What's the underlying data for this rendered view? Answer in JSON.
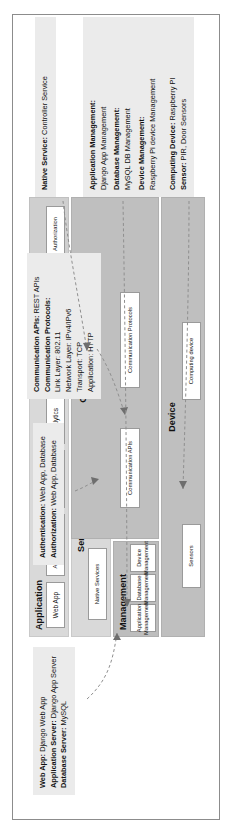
{
  "figure": {
    "orientation": "rotated-90-ccw",
    "colors": {
      "layer_light": "#d9d9d9",
      "layer_dark": "#bfbfbf",
      "cell_fill": "#ffffff",
      "callout_fill": "#ebebeb",
      "connector": "#8f8f8f",
      "frame_border": "#8c8c8c"
    }
  },
  "stack": {
    "layers": [
      {
        "id": "application",
        "label": "Application",
        "cells": [
          {
            "label": "Web App"
          },
          {
            "label": "Application Server"
          },
          {
            "label": "Database Server"
          },
          {
            "label": "Analytics"
          },
          {
            "label": "Observer"
          }
        ]
      },
      {
        "id": "security",
        "label": "Security",
        "cells": [
          {
            "label": "Authentication"
          },
          {
            "label": "Authorization"
          }
        ]
      },
      {
        "id": "services",
        "label": "Services",
        "cells": [
          {
            "label": "Native Services"
          },
          {
            "label": "Web Services"
          }
        ]
      },
      {
        "id": "management",
        "label": "Management",
        "cells": [
          {
            "label": "Application Management"
          },
          {
            "label": "Database Management"
          },
          {
            "label": "Device Management"
          }
        ]
      },
      {
        "id": "communication",
        "label": "Communication",
        "cells": [
          {
            "label": "Communication APIs"
          },
          {
            "label": "Communication Protocols"
          }
        ]
      },
      {
        "id": "device",
        "label": "Device",
        "cells": [
          {
            "label": "Sensors"
          },
          {
            "label": "Computing device"
          }
        ]
      }
    ]
  },
  "callouts": {
    "application_stack": {
      "id": "callout-application-stack",
      "lines": [
        {
          "term": "Web App:",
          "value": " Django Web App"
        },
        {
          "term": "Application Server:",
          "value": " Django App Server"
        },
        {
          "term": "Database Server:",
          "value": " MySQL"
        }
      ]
    },
    "security": {
      "id": "callout-security",
      "lines": [
        {
          "term": "Authentication:",
          "value": " Web App, Database"
        },
        {
          "term": "Authorization:",
          "value": " Web App, Database"
        }
      ]
    },
    "communication": {
      "id": "callout-communication",
      "lines": [
        {
          "term": "Communication APIs:",
          "value": " REST APIs"
        },
        {
          "term": "Communication Protocols:",
          "value": ""
        },
        {
          "term": "",
          "value": "Link Layer: 802.11"
        },
        {
          "term": "",
          "value": "Network Layer: IPv4/IPv6"
        },
        {
          "term": "",
          "value": "Transport: TCP"
        },
        {
          "term": "",
          "value": "Application: HTTP"
        }
      ]
    },
    "native_service": {
      "id": "callout-native-service",
      "lines": [
        {
          "term": "Native Service:",
          "value": " Controller Service"
        }
      ]
    },
    "management": {
      "id": "callout-management",
      "lines": [
        {
          "term": "Application Management:",
          "value": ""
        },
        {
          "term": "",
          "value": "Django App Management"
        },
        {
          "term": "Database Management:",
          "value": ""
        },
        {
          "term": "",
          "value": "MySQL DB Management"
        },
        {
          "term": "Device Management:",
          "value": ""
        },
        {
          "term": "",
          "value": "Raspberry Pi device Management"
        }
      ]
    },
    "device": {
      "id": "callout-device",
      "lines": [
        {
          "term": "Computing Device:",
          "value": " Raspberry PI"
        },
        {
          "term": "Sensor:",
          "value": " PIR, Door Sensors"
        }
      ]
    }
  }
}
